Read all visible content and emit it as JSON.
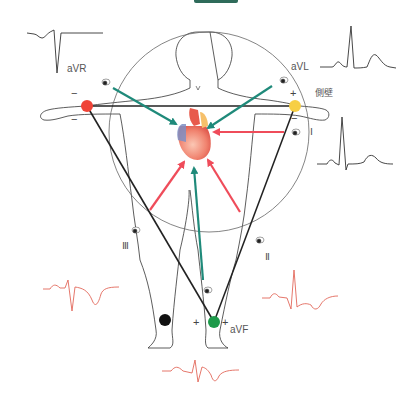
{
  "title_bar": {
    "color": "#2f6b5a"
  },
  "labels": {
    "aVR": "aVR",
    "aVL": "aVL",
    "aVF": "aVF",
    "lateral_wall": "側壁",
    "lead_I": "Ⅰ",
    "lead_II": "Ⅱ",
    "lead_III": "Ⅲ",
    "plus": "+",
    "minus": "−"
  },
  "electrodes": [
    {
      "name": "right-arm",
      "color": "#ef4438",
      "x": 87,
      "y": 106
    },
    {
      "name": "left-arm",
      "color": "#f7cf45",
      "x": 295,
      "y": 106
    },
    {
      "name": "left-leg",
      "color": "#1d9a4a",
      "x": 214,
      "y": 322
    },
    {
      "name": "right-leg",
      "color": "#111111",
      "x": 165,
      "y": 320
    }
  ],
  "colors": {
    "augmented_arrow": "#1f8a7a",
    "limb_arrow": "#ef4c5a",
    "triangle": "#222222",
    "circle": "#555555",
    "ecg_black": "#333333",
    "ecg_red": "#e2685a"
  },
  "waveforms": [
    {
      "lead": "aVR",
      "style": "black",
      "shape": "negative QRS"
    },
    {
      "lead": "aVL",
      "style": "black",
      "shape": "upright QRS"
    },
    {
      "lead": "I",
      "style": "black",
      "shape": "upright QRS"
    },
    {
      "lead": "III",
      "style": "red",
      "shape": "inverted T"
    },
    {
      "lead": "II",
      "style": "red",
      "shape": "upright QRS, inverted T"
    },
    {
      "lead": "aVF",
      "style": "red",
      "shape": "small QRS, inverted T"
    }
  ]
}
